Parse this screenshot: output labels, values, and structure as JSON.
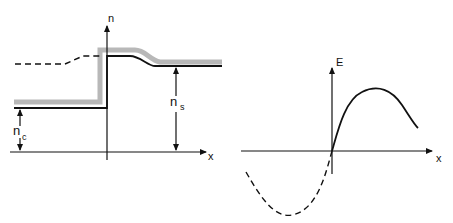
{
  "left_diagram": {
    "y_axis_label": "n",
    "x_axis_label": "x",
    "annotations": {
      "core_index": "n",
      "core_index_sub": "c",
      "substrate_index": "n",
      "substrate_index_sub": "s"
    }
  },
  "right_diagram": {
    "y_axis_label": "E",
    "x_axis_label": "x"
  },
  "colors": {
    "line": "#111111",
    "shading": "#b8b8b8"
  }
}
